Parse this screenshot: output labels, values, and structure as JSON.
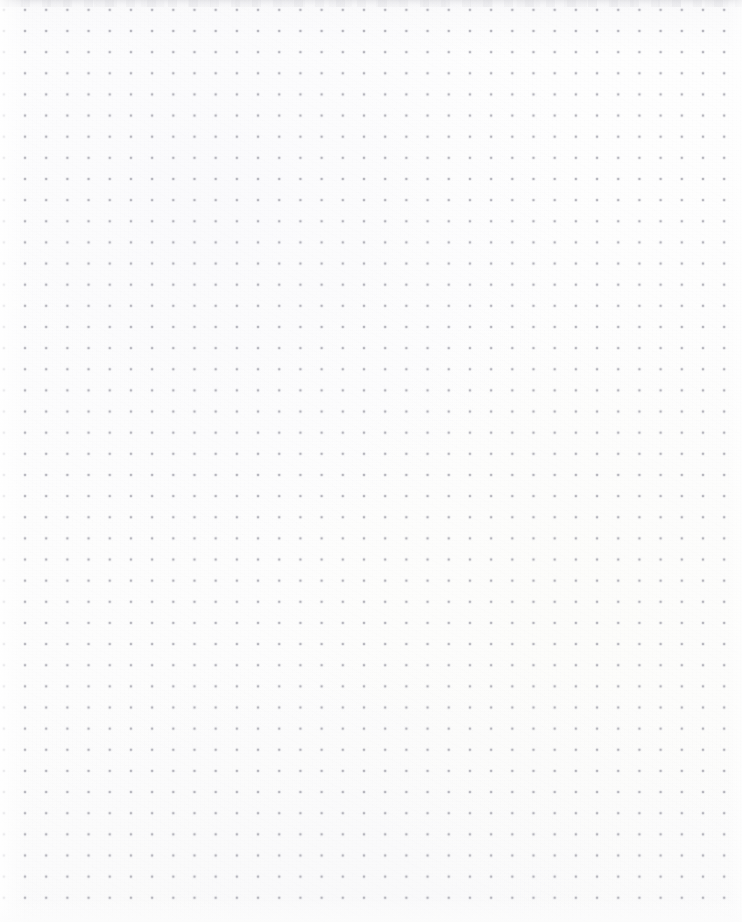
{
  "page": {
    "kind": "dot-grid-paper",
    "width_px": 742,
    "height_px": 922,
    "content_text": "",
    "has_written_content": false
  },
  "paper": {
    "background_color": "#fdfdfd",
    "background_color_secondary": "#fafafb",
    "texture": "subtle paper grain",
    "edge_band_top_color": "#cdcdd2",
    "vignette_left_color": "#ffffff",
    "vignette_bottom_color": "#fcfcfc"
  },
  "grid": {
    "dot_color": "#b0b0b8",
    "dot_halo_color": "#c6c6ce",
    "dot_diameter_px": 1.6,
    "spacing_x_px": 21.2,
    "spacing_y_px": 21.15,
    "origin_x_px": 25,
    "origin_y_px": 31,
    "columns": 34,
    "rows": 42,
    "first_dot_label": "25, 31",
    "last_dot_label": "724, 898"
  }
}
